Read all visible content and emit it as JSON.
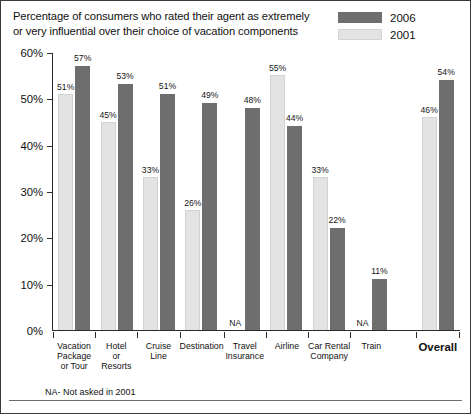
{
  "chart_data": {
    "type": "bar",
    "title": "Percentage of consumers who rated their agent as extremely or very influential over their choice of vacation components",
    "title_line1": "Percentage of consumers who rated their agent as extremely",
    "title_line2": "or very influential over their choice of vacation components",
    "xlabel": "",
    "ylabel": "",
    "ylim": [
      0,
      60
    ],
    "yticks": [
      "0%",
      "10%",
      "20%",
      "30%",
      "40%",
      "50%",
      "60%"
    ],
    "ytick_values": [
      0,
      10,
      20,
      30,
      40,
      50,
      60
    ],
    "grid": false,
    "legend_position": "top-right",
    "categories": [
      "Vacation Package or Tour",
      "Hotel or Resorts",
      "Cruise Line",
      "Destination",
      "Travel Insurance",
      "Airline",
      "Car Rental Company",
      "Train",
      "Overall"
    ],
    "category_lines": [
      [
        "Vacation",
        "Package",
        "or Tour"
      ],
      [
        "Hotel",
        "or",
        "Resorts"
      ],
      [
        "Cruise",
        "Line"
      ],
      [
        "Destination"
      ],
      [
        "Travel",
        "Insurance"
      ],
      [
        "Airline"
      ],
      [
        "Car Rental",
        "Company"
      ],
      [
        "Train"
      ],
      [
        "Overall"
      ]
    ],
    "series": [
      {
        "name": "2001",
        "color": "#e3e3e3",
        "values": [
          51,
          45,
          33,
          26,
          null,
          55,
          33,
          null,
          46
        ],
        "labels": [
          "51%",
          "45%",
          "33%",
          "26%",
          "NA",
          "55%",
          "33%",
          "NA",
          "46%"
        ]
      },
      {
        "name": "2006",
        "color": "#6e6e6e",
        "values": [
          57,
          53,
          51,
          49,
          48,
          44,
          22,
          11,
          54
        ],
        "labels": [
          "57%",
          "53%",
          "51%",
          "49%",
          "48%",
          "44%",
          "22%",
          "11%",
          "54%"
        ]
      }
    ],
    "series_order_in_group": [
      "2001",
      "2006"
    ],
    "footnote": "NA- Not asked in 2001",
    "na_marker": "NA"
  },
  "legend": {
    "items": [
      {
        "label": "2006",
        "color": "#6e6e6e"
      },
      {
        "label": "2001",
        "color": "#e3e3e3"
      }
    ]
  },
  "colors": {
    "bar_2006": "#6e6e6e",
    "bar_2001": "#e3e3e3",
    "axis": "#2b2b2b",
    "text": "#111111",
    "frame": "#3a3a3a"
  }
}
